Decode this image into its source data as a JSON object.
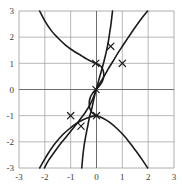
{
  "figure": {
    "title": "",
    "background_color": "#ffffff",
    "curve_color": "#1b1b1b",
    "grid_color": "#9a9a9a",
    "axis_color": "#6e6e6e"
  },
  "chart_data": {
    "type": "line",
    "title": "",
    "xlabel": "",
    "ylabel": "",
    "xlim": [
      -3,
      3
    ],
    "ylim": [
      -3,
      3
    ],
    "grid": true,
    "legend": null,
    "xticks": [
      -3,
      -2,
      -1,
      0,
      1,
      2,
      3
    ],
    "xtick_labels": [
      "-3",
      "-2",
      "-1",
      "0",
      "1",
      "2",
      "3"
    ],
    "yticks": [
      -3,
      -2,
      -1,
      0,
      1,
      2,
      3
    ],
    "ytick_labels": [
      "-3",
      "-2",
      "-1",
      "0",
      "1",
      "2",
      "3"
    ],
    "series": [
      {
        "name": "curve-upper-left-descending",
        "points": [
          [
            -2.2,
            3.0
          ],
          [
            -2.0,
            2.62
          ],
          [
            -1.75,
            2.25
          ],
          [
            -1.5,
            1.98
          ],
          [
            -1.2,
            1.7
          ],
          [
            -0.9,
            1.48
          ],
          [
            -0.6,
            1.3
          ],
          [
            -0.35,
            1.15
          ],
          [
            -0.15,
            1.05
          ],
          [
            -0.03,
            1.0
          ]
        ]
      },
      {
        "name": "curve-s-shape-through-origin",
        "points": [
          [
            -0.03,
            1.0
          ],
          [
            0.16,
            0.9
          ],
          [
            0.26,
            0.72
          ],
          [
            0.28,
            0.5
          ],
          [
            0.22,
            0.3
          ],
          [
            0.1,
            0.13
          ],
          [
            -0.02,
            0.0
          ],
          [
            -0.14,
            -0.13
          ],
          [
            -0.24,
            -0.3
          ],
          [
            -0.28,
            -0.5
          ],
          [
            -0.26,
            -0.72
          ],
          [
            -0.16,
            -0.9
          ],
          [
            0.0,
            -1.0
          ]
        ]
      },
      {
        "name": "curve-upper-steep-descending",
        "points": [
          [
            0.62,
            3.0
          ],
          [
            0.56,
            2.5
          ],
          [
            0.5,
            2.1
          ],
          [
            0.45,
            1.78
          ],
          [
            0.38,
            1.45
          ],
          [
            0.3,
            1.12
          ],
          [
            0.2,
            0.75
          ],
          [
            0.1,
            0.4
          ],
          [
            0.02,
            0.1
          ],
          [
            -0.02,
            0.0
          ]
        ]
      },
      {
        "name": "curve-right-ascending",
        "points": [
          [
            -0.02,
            0.0
          ],
          [
            0.12,
            0.22
          ],
          [
            0.28,
            0.48
          ],
          [
            0.45,
            0.78
          ],
          [
            0.62,
            1.05
          ],
          [
            0.82,
            1.38
          ],
          [
            1.02,
            1.68
          ],
          [
            1.25,
            2.02
          ],
          [
            1.5,
            2.38
          ],
          [
            1.75,
            2.72
          ],
          [
            1.98,
            3.0
          ]
        ]
      },
      {
        "name": "curve-lower-left-ascending",
        "points": [
          [
            -2.02,
            -3.0
          ],
          [
            -1.85,
            -2.7
          ],
          [
            -1.6,
            -2.35
          ],
          [
            -1.35,
            -2.02
          ],
          [
            -1.1,
            -1.72
          ],
          [
            -0.88,
            -1.45
          ],
          [
            -0.68,
            -1.2
          ],
          [
            -0.45,
            -0.9
          ],
          [
            -0.25,
            -0.58
          ],
          [
            -0.1,
            -0.25
          ],
          [
            -0.02,
            0.0
          ]
        ]
      },
      {
        "name": "curve-lower-steep-descending",
        "points": [
          [
            -0.02,
            0.0
          ],
          [
            -0.1,
            -0.35
          ],
          [
            -0.18,
            -0.72
          ],
          [
            -0.28,
            -1.1
          ],
          [
            -0.35,
            -1.45
          ],
          [
            -0.42,
            -1.8
          ],
          [
            -0.48,
            -2.15
          ],
          [
            -0.53,
            -2.55
          ],
          [
            -0.57,
            -3.0
          ]
        ]
      },
      {
        "name": "curve-lower-right-descending",
        "points": [
          [
            0.0,
            -1.0
          ],
          [
            0.25,
            -1.1
          ],
          [
            0.5,
            -1.25
          ],
          [
            0.78,
            -1.48
          ],
          [
            1.05,
            -1.75
          ],
          [
            1.3,
            -2.05
          ],
          [
            1.55,
            -2.38
          ],
          [
            1.78,
            -2.7
          ],
          [
            1.98,
            -3.0
          ]
        ]
      },
      {
        "name": "curve-left-lower-descending",
        "points": [
          [
            -2.2,
            -3.0
          ],
          [
            -2.0,
            -2.65
          ],
          [
            -1.78,
            -2.3
          ],
          [
            -1.55,
            -2.0
          ],
          [
            -1.3,
            -1.72
          ],
          [
            -1.05,
            -1.5
          ],
          [
            -0.78,
            -1.3
          ],
          [
            -0.5,
            -1.15
          ],
          [
            -0.25,
            -1.05
          ],
          [
            0.0,
            -1.0
          ]
        ]
      }
    ],
    "markers": {
      "symbol": "x",
      "points": [
        [
          -0.03,
          1.0
        ],
        [
          0.55,
          1.65
        ],
        [
          1.0,
          1.0
        ],
        [
          -0.02,
          0.0
        ],
        [
          -1.0,
          -1.0
        ],
        [
          0.0,
          -1.0
        ],
        [
          -0.6,
          -1.4
        ]
      ]
    }
  }
}
